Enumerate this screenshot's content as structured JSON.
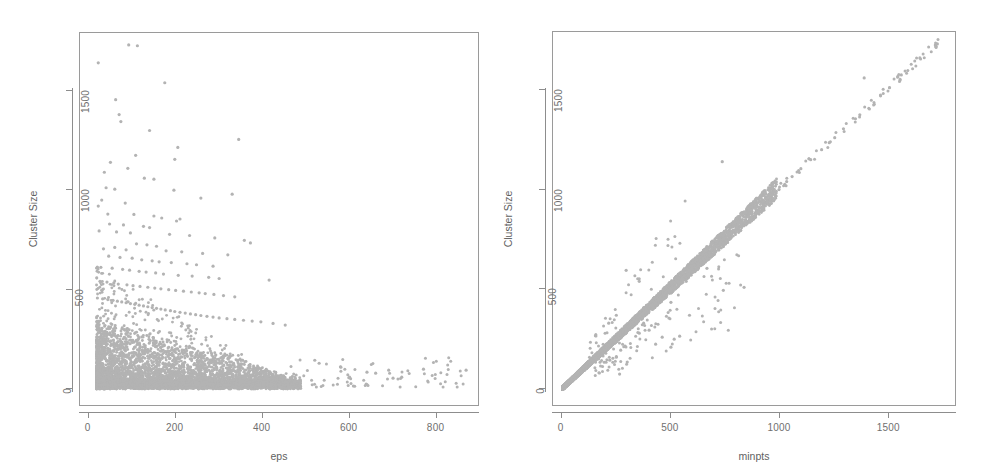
{
  "figure": {
    "background": "#ffffff",
    "point_color": "#b3b3b3",
    "axis_color": "#8d8d8d",
    "label_color": "#6f6f6f"
  },
  "chart_data": [
    {
      "type": "scatter",
      "panel": "left",
      "title": "",
      "xlabel": "eps",
      "ylabel": "Cluster Size",
      "xlim": [
        -20,
        900
      ],
      "ylim": [
        -90,
        1790
      ],
      "xticks": [
        0,
        200,
        400,
        600,
        800
      ],
      "yticks": [
        0,
        500,
        1000,
        1500
      ],
      "xticklabels": [
        "0",
        "200",
        "400",
        "600",
        "800"
      ],
      "yticklabels": [
        "0",
        "500",
        "1000",
        "1500"
      ],
      "grid": false,
      "legend": null,
      "marker": "filled-circle",
      "marker_size": 2,
      "n_points_approx": 4200,
      "description": "Dense wedge of points concentrated at low eps and low cluster size; density decays rapidly with increasing eps; sparse high-cluster-size outliers scatter up to ~1730 at eps below ~350; a thin tail of low-size points extends out to eps ~870.",
      "points": [
        [
          22,
          1640
        ],
        [
          92,
          1730
        ],
        [
          112,
          1726
        ],
        [
          175,
          1540
        ],
        [
          62,
          1455
        ],
        [
          70,
          1380
        ],
        [
          74,
          1345
        ],
        [
          140,
          1300
        ],
        [
          345,
          1255
        ],
        [
          205,
          1215
        ],
        [
          108,
          1175
        ],
        [
          50,
          1140
        ],
        [
          198,
          1155
        ],
        [
          36,
          1090
        ],
        [
          90,
          1110
        ],
        [
          128,
          1060
        ],
        [
          150,
          1055
        ],
        [
          40,
          1012
        ],
        [
          60,
          1005
        ],
        [
          196,
          1000
        ],
        [
          330,
          980
        ],
        [
          258,
          960
        ],
        [
          30,
          950
        ],
        [
          84,
          935
        ],
        [
          22,
          920
        ],
        [
          44,
          880
        ],
        [
          104,
          878
        ],
        [
          150,
          870
        ],
        [
          168,
          860
        ],
        [
          210,
          855
        ],
        [
          202,
          845
        ],
        [
          48,
          830
        ],
        [
          80,
          825
        ],
        [
          126,
          818
        ],
        [
          140,
          812
        ],
        [
          24,
          795
        ],
        [
          64,
          790
        ],
        [
          96,
          785
        ],
        [
          186,
          778
        ],
        [
          232,
          772
        ],
        [
          290,
          760
        ],
        [
          358,
          748
        ],
        [
          372,
          735
        ],
        [
          110,
          730
        ],
        [
          134,
          725
        ],
        [
          156,
          718
        ],
        [
          60,
          712
        ],
        [
          34,
          705
        ],
        [
          86,
          700
        ],
        [
          178,
          695
        ],
        [
          214,
          690
        ],
        [
          262,
          682
        ],
        [
          320,
          675
        ],
        [
          46,
          668
        ],
        [
          72,
          662
        ],
        [
          100,
          658
        ],
        [
          122,
          650
        ],
        [
          146,
          645
        ],
        [
          162,
          640
        ],
        [
          190,
          636
        ],
        [
          226,
          630
        ],
        [
          248,
          625
        ],
        [
          286,
          618
        ],
        [
          28,
          612
        ],
        [
          54,
          608
        ],
        [
          78,
          602
        ],
        [
          94,
          598
        ],
        [
          116,
          592
        ],
        [
          132,
          588
        ],
        [
          154,
          584
        ],
        [
          172,
          578
        ],
        [
          206,
          572
        ],
        [
          238,
          568
        ],
        [
          276,
          562
        ],
        [
          300,
          556
        ],
        [
          415,
          548
        ],
        [
          26,
          542
        ],
        [
          42,
          538
        ],
        [
          58,
          534
        ],
        [
          68,
          528
        ],
        [
          88,
          524
        ],
        [
          102,
          520
        ],
        [
          118,
          516
        ],
        [
          136,
          512
        ],
        [
          152,
          508
        ],
        [
          166,
          504
        ],
        [
          184,
          500
        ],
        [
          200,
          496
        ],
        [
          218,
          492
        ],
        [
          236,
          488
        ],
        [
          254,
          484
        ],
        [
          268,
          480
        ],
        [
          288,
          476
        ],
        [
          310,
          470
        ],
        [
          336,
          464
        ],
        [
          20,
          458
        ],
        [
          32,
          454
        ],
        [
          44,
          450
        ],
        [
          56,
          446
        ],
        [
          66,
          442
        ],
        [
          76,
          438
        ],
        [
          86,
          434
        ],
        [
          96,
          430
        ],
        [
          106,
          426
        ],
        [
          116,
          422
        ],
        [
          126,
          418
        ],
        [
          136,
          414
        ],
        [
          146,
          410
        ],
        [
          156,
          406
        ],
        [
          166,
          402
        ],
        [
          176,
          398
        ],
        [
          188,
          394
        ],
        [
          198,
          390
        ],
        [
          210,
          386
        ],
        [
          222,
          382
        ],
        [
          234,
          378
        ],
        [
          246,
          374
        ],
        [
          258,
          370
        ],
        [
          272,
          366
        ],
        [
          286,
          362
        ],
        [
          300,
          358
        ],
        [
          318,
          354
        ],
        [
          336,
          350
        ],
        [
          356,
          346
        ],
        [
          376,
          342
        ],
        [
          396,
          338
        ],
        [
          424,
          330
        ],
        [
          452,
          322
        ],
        [
          520,
          145
        ],
        [
          530,
          130
        ],
        [
          580,
          110
        ],
        [
          600,
          60
        ],
        [
          640,
          85
        ],
        [
          660,
          80
        ],
        [
          690,
          95
        ],
        [
          700,
          55
        ],
        [
          720,
          60
        ],
        [
          770,
          100
        ],
        [
          868,
          95
        ]
      ]
    },
    {
      "type": "scatter",
      "panel": "right",
      "title": "",
      "xlabel": "minpts",
      "ylabel": "Cluster Size",
      "xlim": [
        -40,
        1810
      ],
      "ylim": [
        -90,
        1790
      ],
      "xticks": [
        0,
        500,
        1000,
        1500
      ],
      "yticks": [
        0,
        500,
        1000,
        1500
      ],
      "xticklabels": [
        "0",
        "500",
        "1000",
        "1500"
      ],
      "yticklabels": [
        "0",
        "500",
        "1000",
        "1500"
      ],
      "grid": false,
      "legend": null,
      "marker": "filled-circle",
      "marker_size": 2,
      "n_points_approx": 4200,
      "description": "Strong near-linear relationship: cluster size increases approximately 1:1 with minpts. Dense band concentrated below minpts 400, thinning into sparse individual points above minpts 900 reaching ~1730. A handful of outliers sit below the diagonal line.",
      "points": [
        [
          1720,
          1730
        ],
        [
          1640,
          1660
        ],
        [
          1555,
          1575
        ],
        [
          1385,
          1560
        ],
        [
          1460,
          1470
        ],
        [
          1365,
          1375
        ],
        [
          1345,
          1355
        ],
        [
          1290,
          1305
        ],
        [
          1250,
          1260
        ],
        [
          1225,
          1235
        ],
        [
          1190,
          1200
        ],
        [
          1140,
          1150
        ],
        [
          1095,
          1105
        ],
        [
          1055,
          1065
        ],
        [
          1030,
          1040
        ],
        [
          995,
          1000
        ],
        [
          960,
          975
        ],
        [
          935,
          955
        ],
        [
          920,
          940
        ],
        [
          905,
          960
        ],
        [
          890,
          900
        ],
        [
          870,
          880
        ],
        [
          855,
          865
        ],
        [
          840,
          850
        ],
        [
          820,
          830
        ],
        [
          800,
          812
        ],
        [
          785,
          795
        ],
        [
          770,
          780
        ],
        [
          755,
          765
        ],
        [
          740,
          750
        ],
        [
          735,
          1140
        ],
        [
          725,
          735
        ],
        [
          710,
          718
        ],
        [
          700,
          708
        ],
        [
          690,
          700
        ],
        [
          675,
          685
        ],
        [
          665,
          675
        ],
        [
          655,
          665
        ],
        [
          645,
          655
        ],
        [
          635,
          645
        ],
        [
          700,
          680
        ],
        [
          740,
          495
        ],
        [
          835,
          510
        ],
        [
          665,
          605
        ],
        [
          620,
          630
        ],
        [
          610,
          620
        ],
        [
          600,
          610
        ],
        [
          590,
          600
        ],
        [
          580,
          590
        ],
        [
          575,
          585
        ],
        [
          570,
          540
        ],
        [
          560,
          570
        ],
        [
          550,
          560
        ],
        [
          540,
          550
        ],
        [
          530,
          540
        ],
        [
          520,
          530
        ],
        [
          515,
          250
        ],
        [
          505,
          515
        ],
        [
          500,
          435
        ],
        [
          495,
          505
        ],
        [
          485,
          495
        ],
        [
          475,
          485
        ],
        [
          465,
          475
        ],
        [
          455,
          465
        ],
        [
          450,
          460
        ],
        [
          440,
          450
        ],
        [
          430,
          440
        ],
        [
          425,
          435
        ],
        [
          415,
          425
        ],
        [
          410,
          420
        ],
        [
          400,
          410
        ],
        [
          395,
          405
        ],
        [
          390,
          400
        ],
        [
          385,
          395
        ],
        [
          380,
          390
        ],
        [
          375,
          385
        ],
        [
          370,
          380
        ],
        [
          365,
          375
        ],
        [
          360,
          370
        ],
        [
          355,
          365
        ],
        [
          350,
          360
        ],
        [
          345,
          355
        ],
        [
          340,
          350
        ],
        [
          335,
          345
        ],
        [
          330,
          340
        ],
        [
          325,
          335
        ],
        [
          320,
          330
        ],
        [
          315,
          325
        ],
        [
          310,
          320
        ],
        [
          305,
          315
        ],
        [
          300,
          310
        ],
        [
          295,
          305
        ],
        [
          290,
          300
        ],
        [
          285,
          295
        ],
        [
          280,
          290
        ],
        [
          275,
          285
        ],
        [
          270,
          280
        ],
        [
          265,
          275
        ],
        [
          260,
          270
        ],
        [
          255,
          265
        ],
        [
          250,
          260
        ],
        [
          245,
          255
        ],
        [
          240,
          250
        ],
        [
          235,
          245
        ],
        [
          230,
          240
        ],
        [
          225,
          235
        ],
        [
          220,
          230
        ],
        [
          215,
          225
        ],
        [
          210,
          220
        ],
        [
          205,
          215
        ],
        [
          200,
          210
        ],
        [
          195,
          205
        ],
        [
          190,
          200
        ],
        [
          185,
          195
        ],
        [
          180,
          190
        ],
        [
          175,
          185
        ],
        [
          170,
          180
        ],
        [
          165,
          175
        ],
        [
          160,
          170
        ],
        [
          155,
          165
        ],
        [
          150,
          160
        ],
        [
          145,
          155
        ],
        [
          140,
          150
        ],
        [
          135,
          145
        ],
        [
          130,
          140
        ],
        [
          125,
          135
        ],
        [
          120,
          130
        ],
        [
          115,
          125
        ],
        [
          110,
          120
        ],
        [
          105,
          115
        ],
        [
          100,
          110
        ],
        [
          95,
          105
        ],
        [
          90,
          100
        ],
        [
          85,
          95
        ],
        [
          80,
          90
        ],
        [
          75,
          85
        ],
        [
          70,
          80
        ],
        [
          65,
          75
        ],
        [
          60,
          70
        ],
        [
          55,
          65
        ],
        [
          50,
          60
        ],
        [
          45,
          55
        ],
        [
          40,
          50
        ],
        [
          35,
          45
        ],
        [
          30,
          40
        ],
        [
          25,
          35
        ],
        [
          20,
          30
        ],
        [
          15,
          25
        ],
        [
          10,
          20
        ],
        [
          5,
          15
        ],
        [
          295,
          595
        ],
        [
          355,
          540
        ],
        [
          250,
          370
        ],
        [
          215,
          330
        ],
        [
          330,
          345
        ],
        [
          375,
          330
        ],
        [
          400,
          295
        ],
        [
          355,
          280
        ],
        [
          290,
          215
        ],
        [
          270,
          195
        ],
        [
          265,
          75
        ],
        [
          300,
          135
        ],
        [
          430,
          225
        ],
        [
          460,
          260
        ],
        [
          470,
          470
        ],
        [
          500,
          210
        ],
        [
          540,
          265
        ],
        [
          585,
          370
        ],
        [
          250,
          160
        ],
        [
          220,
          145
        ]
      ]
    }
  ],
  "panels": [
    {
      "id": "left",
      "xlabel": "eps",
      "ylabel": "Cluster Size",
      "xticklabels": [
        "0",
        "200",
        "400",
        "600",
        "800"
      ],
      "yticklabels": [
        "0",
        "500",
        "1000",
        "1500"
      ]
    },
    {
      "id": "right",
      "xlabel": "minpts",
      "ylabel": "Cluster Size",
      "xticklabels": [
        "0",
        "500",
        "1000",
        "1500"
      ],
      "yticklabels": [
        "0",
        "500",
        "1000",
        "1500"
      ]
    }
  ]
}
